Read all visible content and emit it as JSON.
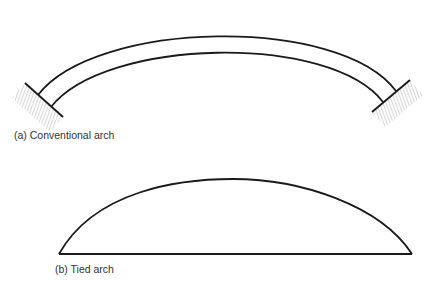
{
  "figure": {
    "colors": {
      "line": "#1a1a1a",
      "hatch": "#777777",
      "text": "#333333",
      "background": "#ffffff"
    },
    "panels": [
      {
        "id": "a",
        "label": "(a) Conventional arch",
        "elements": [
          "outer-arch-curve",
          "inner-arch-curve",
          "left-fixed-support",
          "right-fixed-support"
        ]
      },
      {
        "id": "b",
        "label": "(b) Tied arch",
        "elements": [
          "arch-curve",
          "tie-beam"
        ]
      }
    ]
  }
}
